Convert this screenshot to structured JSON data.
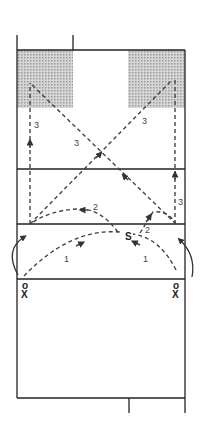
{
  "diagram": {
    "title": "",
    "court": {
      "left_x": 17,
      "right_x": 185,
      "top_y": 50,
      "bottom_y": 398,
      "lines_y": [
        169,
        224,
        279
      ],
      "shaded_zones": [
        {
          "name": "left-target-zone",
          "x": 17,
          "y": 50,
          "w": 56,
          "h": 58
        },
        {
          "name": "right-target-zone",
          "x": 128,
          "y": 50,
          "w": 57,
          "h": 58
        }
      ],
      "shade_color": "#c8c8c8"
    },
    "players": [
      {
        "id": "left-pair",
        "top": "o",
        "bottom": "X",
        "x": 25
      },
      {
        "id": "right-pair",
        "top": "o",
        "bottom": "X",
        "x": 176
      }
    ],
    "setter_label": "S",
    "path_labels": {
      "one_left": "1",
      "one_right": "1",
      "two_left": "2",
      "two_right": "2",
      "three_left_vertical": "3",
      "three_left_diagonal": "3",
      "three_right_diagonal": "3",
      "three_right_vertical": "3"
    },
    "colors": {
      "line": "#222222",
      "dash": "#444444",
      "background": "#ffffff"
    }
  }
}
